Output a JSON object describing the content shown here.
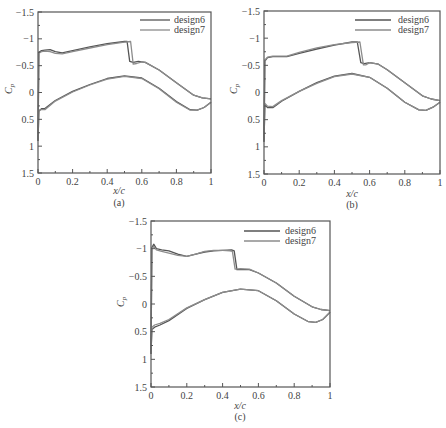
{
  "colors": {
    "design6": "#555555",
    "design7": "#8c8c8c",
    "axis": "#555555",
    "background": "#ffffff"
  },
  "chart_data": [
    {
      "type": "line",
      "panel": "a",
      "caption": "(a)",
      "title": "",
      "xlabel": "x/c",
      "ylabel": "Cp",
      "xlim": [
        0,
        1
      ],
      "ylim": [
        1.5,
        -1.5
      ],
      "y_inverted": true,
      "xticks": [
        "0",
        "0.2",
        "0.4",
        "0.6",
        "0.8",
        "1"
      ],
      "yticks": [
        "-1.5",
        "-1",
        "-0.5",
        "0",
        "0.5",
        "1",
        "1.5"
      ],
      "grid": false,
      "legend_position": "upper right",
      "series": [
        {
          "name": "design6",
          "upper_surface": {
            "x": [
              0,
              0.005,
              0.02,
              0.04,
              0.07,
              0.1,
              0.14,
              0.2,
              0.3,
              0.4,
              0.5,
              0.515,
              0.53,
              0.55,
              0.58,
              0.62,
              0.7,
              0.8,
              0.9,
              0.95,
              1.0
            ],
            "y": [
              0.9,
              -0.75,
              -0.78,
              -0.79,
              -0.8,
              -0.76,
              -0.74,
              -0.78,
              -0.85,
              -0.91,
              -0.95,
              -0.95,
              -0.58,
              -0.56,
              -0.58,
              -0.56,
              -0.42,
              -0.18,
              0.05,
              0.1,
              0.12
            ]
          },
          "lower_surface": {
            "x": [
              0,
              0.005,
              0.02,
              0.04,
              0.1,
              0.2,
              0.3,
              0.4,
              0.5,
              0.6,
              0.7,
              0.8,
              0.88,
              0.92,
              0.96,
              1.0
            ],
            "y": [
              0.9,
              0.35,
              0.3,
              0.3,
              0.15,
              -0.02,
              -0.15,
              -0.26,
              -0.31,
              -0.27,
              -0.08,
              0.17,
              0.32,
              0.33,
              0.28,
              0.18
            ]
          }
        },
        {
          "name": "design7",
          "upper_surface": {
            "x": [
              0,
              0.005,
              0.02,
              0.04,
              0.07,
              0.1,
              0.14,
              0.2,
              0.3,
              0.4,
              0.5,
              0.535,
              0.55,
              0.57,
              0.6,
              0.62,
              0.7,
              0.8,
              0.9,
              0.95,
              1.0
            ],
            "y": [
              0.9,
              -0.73,
              -0.76,
              -0.77,
              -0.76,
              -0.73,
              -0.72,
              -0.76,
              -0.83,
              -0.89,
              -0.94,
              -0.95,
              -0.53,
              -0.54,
              -0.57,
              -0.56,
              -0.42,
              -0.18,
              0.05,
              0.1,
              0.12
            ]
          },
          "lower_surface": {
            "x": [
              0,
              0.005,
              0.02,
              0.04,
              0.1,
              0.2,
              0.3,
              0.4,
              0.5,
              0.6,
              0.7,
              0.8,
              0.88,
              0.92,
              0.96,
              1.0
            ],
            "y": [
              0.9,
              0.33,
              0.32,
              0.32,
              0.16,
              -0.01,
              -0.14,
              -0.25,
              -0.3,
              -0.26,
              -0.07,
              0.18,
              0.33,
              0.33,
              0.28,
              0.18
            ]
          }
        }
      ]
    },
    {
      "type": "line",
      "panel": "b",
      "caption": "(b)",
      "title": "",
      "xlabel": "x/c",
      "ylabel": "Cp",
      "xlim": [
        0,
        1
      ],
      "ylim": [
        1.5,
        -1.5
      ],
      "y_inverted": true,
      "xticks": [
        "0",
        "0.2",
        "0.4",
        "0.6",
        "0.8",
        "1"
      ],
      "yticks": [
        "-1.5",
        "-1",
        "-0.5",
        "0",
        "0.5",
        "1",
        "1.5"
      ],
      "grid": false,
      "legend_position": "upper right",
      "series": [
        {
          "name": "design6",
          "upper_surface": {
            "x": [
              0,
              0.005,
              0.02,
              0.05,
              0.1,
              0.13,
              0.2,
              0.3,
              0.4,
              0.5,
              0.53,
              0.55,
              0.57,
              0.6,
              0.65,
              0.7,
              0.8,
              0.9,
              0.95,
              1.0
            ],
            "y": [
              0.9,
              -0.58,
              -0.64,
              -0.66,
              -0.66,
              -0.66,
              -0.72,
              -0.8,
              -0.87,
              -0.93,
              -0.93,
              -0.55,
              -0.53,
              -0.55,
              -0.52,
              -0.42,
              -0.18,
              0.06,
              0.12,
              0.15
            ]
          },
          "lower_surface": {
            "x": [
              0,
              0.005,
              0.02,
              0.05,
              0.1,
              0.2,
              0.3,
              0.4,
              0.5,
              0.6,
              0.7,
              0.8,
              0.88,
              0.92,
              0.96,
              1.0
            ],
            "y": [
              0.9,
              0.22,
              0.28,
              0.28,
              0.16,
              -0.02,
              -0.18,
              -0.3,
              -0.35,
              -0.28,
              -0.08,
              0.18,
              0.32,
              0.33,
              0.27,
              0.18
            ]
          }
        },
        {
          "name": "design7",
          "upper_surface": {
            "x": [
              0,
              0.005,
              0.02,
              0.05,
              0.1,
              0.13,
              0.2,
              0.3,
              0.4,
              0.5,
              0.545,
              0.565,
              0.58,
              0.6,
              0.65,
              0.7,
              0.8,
              0.9,
              0.95,
              1.0
            ],
            "y": [
              0.9,
              -0.6,
              -0.65,
              -0.67,
              -0.67,
              -0.67,
              -0.74,
              -0.82,
              -0.88,
              -0.92,
              -0.93,
              -0.51,
              -0.51,
              -0.55,
              -0.52,
              -0.42,
              -0.18,
              0.06,
              0.12,
              0.15
            ]
          },
          "lower_surface": {
            "x": [
              0,
              0.005,
              0.02,
              0.05,
              0.1,
              0.2,
              0.3,
              0.4,
              0.5,
              0.6,
              0.7,
              0.8,
              0.88,
              0.92,
              0.96,
              1.0
            ],
            "y": [
              0.9,
              0.2,
              0.25,
              0.26,
              0.15,
              -0.02,
              -0.17,
              -0.29,
              -0.34,
              -0.28,
              -0.08,
              0.18,
              0.32,
              0.33,
              0.27,
              0.18
            ]
          }
        }
      ]
    },
    {
      "type": "line",
      "panel": "c",
      "caption": "(c)",
      "title": "",
      "xlabel": "x/c",
      "ylabel": "Cp",
      "xlim": [
        0,
        1
      ],
      "ylim": [
        1.5,
        -1.5
      ],
      "y_inverted": true,
      "xticks": [
        "0",
        "0.2",
        "0.4",
        "0.6",
        "0.8",
        "1"
      ],
      "yticks": [
        "-1.5",
        "-1",
        "-0.5",
        "0",
        "0.5",
        "1",
        "1.5"
      ],
      "grid": false,
      "legend_position": "upper right",
      "series": [
        {
          "name": "design6",
          "upper_surface": {
            "x": [
              0,
              0.005,
              0.015,
              0.03,
              0.06,
              0.1,
              0.15,
              0.2,
              0.25,
              0.3,
              0.35,
              0.4,
              0.45,
              0.465,
              0.48,
              0.5,
              0.55,
              0.6,
              0.7,
              0.8,
              0.9,
              0.95,
              1.0
            ],
            "y": [
              0.9,
              -1.02,
              -1.08,
              -1.0,
              -0.98,
              -0.96,
              -0.9,
              -0.86,
              -0.9,
              -0.94,
              -0.96,
              -0.97,
              -0.98,
              -0.96,
              -0.62,
              -0.62,
              -0.62,
              -0.56,
              -0.38,
              -0.14,
              0.05,
              0.1,
              0.12
            ]
          },
          "lower_surface": {
            "x": [
              0,
              0.005,
              0.02,
              0.05,
              0.1,
              0.2,
              0.3,
              0.4,
              0.5,
              0.6,
              0.7,
              0.8,
              0.88,
              0.92,
              0.96,
              1.0
            ],
            "y": [
              0.9,
              0.46,
              0.42,
              0.38,
              0.3,
              0.08,
              -0.08,
              -0.21,
              -0.27,
              -0.24,
              -0.06,
              0.18,
              0.32,
              0.33,
              0.28,
              0.15
            ]
          }
        },
        {
          "name": "design7",
          "upper_surface": {
            "x": [
              0,
              0.005,
              0.015,
              0.03,
              0.06,
              0.1,
              0.15,
              0.2,
              0.25,
              0.3,
              0.35,
              0.4,
              0.44,
              0.455,
              0.47,
              0.5,
              0.55,
              0.6,
              0.7,
              0.8,
              0.9,
              0.95,
              1.0
            ],
            "y": [
              0.9,
              -1.0,
              -1.04,
              -0.98,
              -0.95,
              -0.92,
              -0.88,
              -0.86,
              -0.9,
              -0.95,
              -0.97,
              -0.97,
              -0.96,
              -0.95,
              -0.63,
              -0.64,
              -0.63,
              -0.56,
              -0.38,
              -0.14,
              0.05,
              0.1,
              0.12
            ]
          },
          "lower_surface": {
            "x": [
              0,
              0.005,
              0.02,
              0.05,
              0.1,
              0.2,
              0.3,
              0.4,
              0.5,
              0.6,
              0.7,
              0.8,
              0.88,
              0.92,
              0.96,
              1.0
            ],
            "y": [
              0.9,
              0.42,
              0.38,
              0.35,
              0.28,
              0.07,
              -0.08,
              -0.21,
              -0.27,
              -0.24,
              -0.06,
              0.18,
              0.32,
              0.33,
              0.28,
              0.15
            ]
          }
        }
      ]
    }
  ],
  "panels": [
    {
      "id": "a",
      "caption": "(a)",
      "xlabel": "x/c",
      "ylabel_main": "C",
      "ylabel_sub": "p",
      "legend": [
        {
          "label": "design6"
        },
        {
          "label": "design7"
        }
      ]
    },
    {
      "id": "b",
      "caption": "(b)",
      "xlabel": "x/c",
      "ylabel_main": "C",
      "ylabel_sub": "p",
      "legend": [
        {
          "label": "design6"
        },
        {
          "label": "design7"
        }
      ]
    },
    {
      "id": "c",
      "caption": "(c)",
      "xlabel": "x/c",
      "ylabel_main": "C",
      "ylabel_sub": "p",
      "legend": [
        {
          "label": "design6"
        },
        {
          "label": "design7"
        }
      ]
    }
  ]
}
